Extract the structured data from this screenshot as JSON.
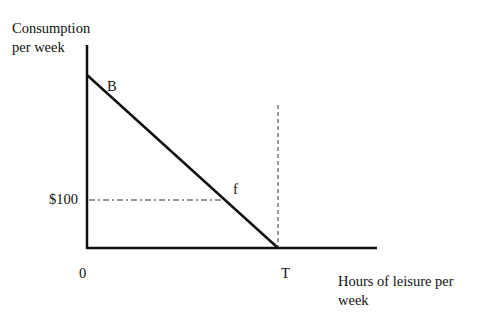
{
  "diagram": {
    "type": "budget-constraint",
    "y_axis_label_line1": "Consumption",
    "y_axis_label_line2": "per week",
    "x_axis_label_line1": "Hours of leisure per",
    "x_axis_label_line2": "week",
    "origin_label": "0",
    "point_b_label": "B",
    "point_f_label": "f",
    "point_t_label": "T",
    "y_tick_label": "$100",
    "line_color": "#111111",
    "dash_color": "#333333"
  }
}
